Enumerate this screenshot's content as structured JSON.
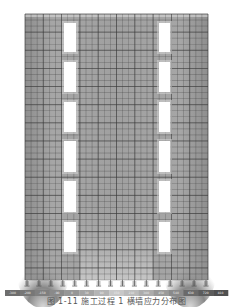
{
  "figure": {
    "wall": {
      "x": 25,
      "y": 14,
      "width": 183,
      "height": 266
    },
    "grid": {
      "cols": 30,
      "rows": 44
    },
    "openings": {
      "columns": [
        {
          "x": 64,
          "width": 12
        },
        {
          "x": 159,
          "width": 11
        }
      ],
      "rows": [
        {
          "y": 23,
          "height": 29
        },
        {
          "y": 62,
          "height": 30
        },
        {
          "y": 102,
          "height": 30
        },
        {
          "y": 141,
          "height": 31
        },
        {
          "y": 181,
          "height": 31
        },
        {
          "y": 222,
          "height": 30
        }
      ]
    },
    "supports": {
      "count": 16,
      "y": 280,
      "type": "fixed"
    },
    "colorbar": {
      "x": 5,
      "y": 290,
      "width": 223,
      "height": 6,
      "labels": [
        "-300",
        "-200",
        "-150",
        "-90",
        "0",
        "30",
        "90",
        "150",
        "210",
        "300",
        "450",
        "540",
        "630",
        "720",
        "810"
      ],
      "colors": [
        "#6e6e6e",
        "#777777",
        "#7f7f7f",
        "#8a8a8a",
        "#969696",
        "#a4a4a4",
        "#b4b4b4",
        "#c8c8c8",
        "#bcbcbc",
        "#acacac",
        "#9a9a9a",
        "#8a8a8a",
        "#6a6a6a",
        "#5c5c5c",
        "#505050"
      ]
    },
    "colors": {
      "wall_fill": "#9c9c9c",
      "wall_fill_light": "#c4c4c4",
      "grid_line": "#3a3a3a",
      "opening": "#ffffff",
      "support": "#444444"
    }
  },
  "caption": "图 1-11  施工过程 1 横墙应力分布图"
}
